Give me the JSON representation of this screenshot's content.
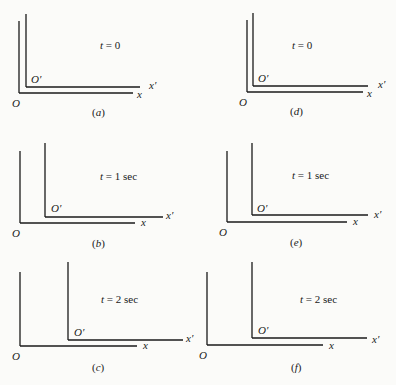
{
  "figure": {
    "line_color": "#1a1a1a",
    "panels": [
      {
        "id": "a",
        "caption": "(a)",
        "time_label": "t = 0",
        "origin": "O",
        "origin_prime": "O′",
        "x_axis": "x",
        "x_prime_axis": "x′",
        "O": {
          "x": 19,
          "yTop": 21,
          "yBase": 93,
          "xEnd": 133
        },
        "Op": {
          "x": 26,
          "yTop": 14,
          "yBase": 87,
          "xEnd": 140
        },
        "labels": {
          "O": [
            12,
            98
          ],
          "Op": [
            31,
            74
          ],
          "x": [
            137,
            89
          ],
          "xp": [
            149,
            80
          ],
          "t": [
            100,
            40
          ],
          "cap": [
            92,
            107
          ]
        }
      },
      {
        "id": "b",
        "caption": "(b)",
        "time_label": "t = 1 sec",
        "origin": "O",
        "origin_prime": "O′",
        "x_axis": "x",
        "x_prime_axis": "x′",
        "O": {
          "x": 20,
          "yTop": 151,
          "yBase": 223,
          "xEnd": 135
        },
        "Op": {
          "x": 45,
          "yTop": 143,
          "yBase": 217,
          "xEnd": 163
        },
        "labels": {
          "O": [
            12,
            228
          ],
          "Op": [
            51,
            203
          ],
          "x": [
            141,
            217
          ],
          "xp": [
            166,
            210
          ],
          "t": [
            100,
            171
          ],
          "cap": [
            92,
            238
          ]
        }
      },
      {
        "id": "c",
        "caption": "(c)",
        "time_label": "t = 2 sec",
        "origin": "O",
        "origin_prime": "O′",
        "x_axis": "x",
        "x_prime_axis": "x′",
        "O": {
          "x": 20,
          "yTop": 272,
          "yBase": 346,
          "xEnd": 137
        },
        "Op": {
          "x": 68,
          "yTop": 262,
          "yBase": 340,
          "xEnd": 183
        },
        "labels": {
          "O": [
            12,
            351
          ],
          "Op": [
            74,
            327
          ],
          "x": [
            143,
            340
          ],
          "xp": [
            186,
            333
          ],
          "t": [
            101,
            294
          ],
          "cap": [
            92,
            362
          ]
        }
      },
      {
        "id": "d",
        "caption": "(d)",
        "time_label": "t = 0",
        "origin": "O",
        "origin_prime": "O′",
        "x_axis": "x",
        "x_prime_axis": "x′",
        "O": {
          "x": 247,
          "yTop": 20,
          "yBase": 92,
          "xEnd": 363
        },
        "Op": {
          "x": 253,
          "yTop": 13,
          "yBase": 86,
          "xEnd": 368
        },
        "labels": {
          "O": [
            239,
            97
          ],
          "Op": [
            258,
            73
          ],
          "x": [
            367,
            88
          ],
          "xp": [
            378,
            79
          ],
          "t": [
            292,
            40
          ],
          "cap": [
            290,
            106
          ]
        }
      },
      {
        "id": "e",
        "caption": "(e)",
        "time_label": "t = 1 sec",
        "origin": "O",
        "origin_prime": "O′",
        "x_axis": "x",
        "x_prime_axis": "x′",
        "O": {
          "x": 227,
          "yTop": 151,
          "yBase": 222,
          "xEnd": 347
        },
        "Op": {
          "x": 252,
          "yTop": 143,
          "yBase": 215,
          "xEnd": 368
        },
        "labels": {
          "O": [
            219,
            227
          ],
          "Op": [
            257,
            203
          ],
          "x": [
            353,
            216
          ],
          "xp": [
            374,
            209
          ],
          "t": [
            292,
            170
          ],
          "cap": [
            290,
            237
          ]
        }
      },
      {
        "id": "f",
        "caption": "(f)",
        "time_label": "t = 2 sec",
        "origin": "O",
        "origin_prime": "O′",
        "x_axis": "x",
        "x_prime_axis": "x′",
        "O": {
          "x": 207,
          "yTop": 272,
          "yBase": 345,
          "xEnd": 323
        },
        "Op": {
          "x": 252,
          "yTop": 262,
          "yBase": 338,
          "xEnd": 367
        },
        "labels": {
          "O": [
            199,
            350
          ],
          "Op": [
            258,
            325
          ],
          "x": [
            329,
            340
          ],
          "xp": [
            372,
            334
          ],
          "t": [
            300,
            294
          ],
          "cap": [
            291,
            362
          ]
        }
      }
    ]
  }
}
